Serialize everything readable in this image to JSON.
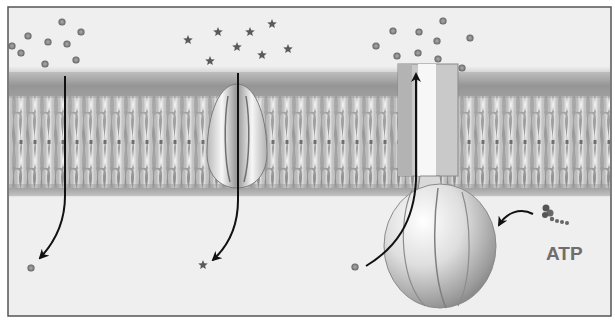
{
  "figure": {
    "frame": {
      "x": 8,
      "y": 7,
      "width": 603,
      "height": 309,
      "border_color": "#555555",
      "background": "#f0f0f0"
    },
    "membrane": {
      "top": 68,
      "bottom": 196,
      "head_color": "#8a8a8a",
      "tail_color": "#e8e8e8"
    },
    "panels": [
      {
        "name": "simple-diffusion",
        "molecule_shape": "circle",
        "molecules_outside": [
          [
            12,
            46
          ],
          [
            28,
            36
          ],
          [
            48,
            42
          ],
          [
            62,
            22
          ],
          [
            81,
            32
          ],
          [
            67,
            44
          ],
          [
            21,
            53
          ],
          [
            45,
            64
          ],
          [
            76,
            60
          ]
        ],
        "molecule_inside": [
          31,
          268
        ],
        "path_x": 65
      },
      {
        "name": "channel-protein",
        "molecule_shape": "star",
        "molecules_outside": [
          [
            188,
            40
          ],
          [
            218,
            32
          ],
          [
            250,
            32
          ],
          [
            272,
            24
          ],
          [
            237,
            47
          ],
          [
            288,
            49
          ],
          [
            210,
            61
          ],
          [
            262,
            55
          ]
        ],
        "molecule_inside": [
          203,
          265
        ],
        "channel_center_x": 237
      },
      {
        "name": "atp-pump",
        "molecule_shape": "circle",
        "molecules_outside": [
          [
            376,
            46
          ],
          [
            393,
            31
          ],
          [
            419,
            32
          ],
          [
            443,
            21
          ],
          [
            470,
            38
          ],
          [
            437,
            41
          ],
          [
            397,
            56
          ],
          [
            418,
            53
          ],
          [
            438,
            59
          ],
          [
            462,
            68
          ]
        ],
        "molecule_inside": [
          355,
          267
        ],
        "label": "ATP"
      }
    ],
    "colors": {
      "arrow": "#111111",
      "molecule": "#777777",
      "protein_light": "#f4f4f4",
      "protein_dark": "#8c8c8c",
      "label": "#6e6e6e"
    }
  }
}
